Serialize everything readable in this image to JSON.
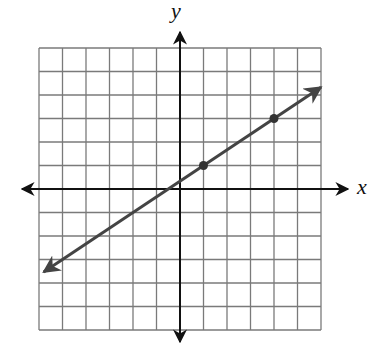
{
  "chart_data": {
    "type": "line",
    "title": "",
    "xlabel": "x",
    "ylabel": "y",
    "xlim": [
      -6,
      6
    ],
    "ylim": [
      -6,
      6
    ],
    "grid": true,
    "grid_step": 1,
    "tick_labels": false,
    "axes_arrows": true,
    "series": [
      {
        "name": "line",
        "equation": "y = (2/3)x + 1/3",
        "slope": 0.6667,
        "intercept": 0.3333,
        "arrows_both_ends": true,
        "x_range": [
          -5.8,
          6
        ],
        "points": [
          {
            "x": 1,
            "y": 1
          },
          {
            "x": 4,
            "y": 3
          }
        ]
      }
    ]
  },
  "labels": {
    "x_axis": "x",
    "y_axis": "y"
  },
  "colors": {
    "grid": "#7a7a7a",
    "axis": "#111111",
    "line": "#444444",
    "point": "#333333"
  }
}
